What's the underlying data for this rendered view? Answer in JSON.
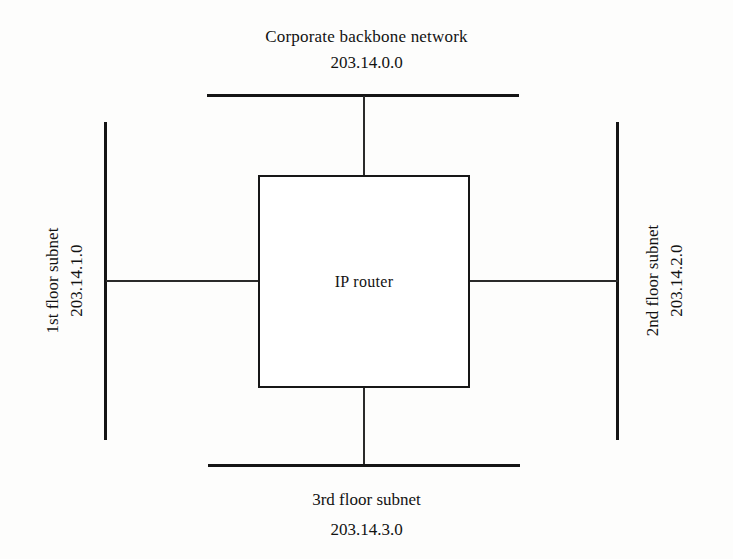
{
  "diagram": {
    "router": {
      "label": "IP router",
      "shape": "rectangle"
    },
    "segments": [
      {
        "id": "backbone",
        "position": "top",
        "name": "Corporate backbone network",
        "address": "203.14.0.0",
        "orientation": "horizontal"
      },
      {
        "id": "first-floor",
        "position": "left",
        "name": "1st floor subnet",
        "address": "203.14.1.0",
        "orientation": "vertical"
      },
      {
        "id": "second-floor",
        "position": "right",
        "name": "2nd floor subnet",
        "address": "203.14.2.0",
        "orientation": "vertical"
      },
      {
        "id": "third-floor",
        "position": "bottom",
        "name": "3rd floor subnet",
        "address": "203.14.3.0",
        "orientation": "horizontal"
      }
    ],
    "colors": {
      "line": "#151515",
      "link": "#2a2a2a",
      "text": "#121212",
      "background": "#fdfdfc"
    }
  }
}
